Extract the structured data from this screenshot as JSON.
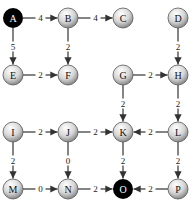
{
  "diagram": {
    "type": "directed-weighted-grid-graph",
    "colors": {
      "edge": "#333333",
      "special_node": "#000000",
      "normal_node_light": "#ffffff",
      "normal_node_dark": "#8a8a8a",
      "label_dark": "#111111",
      "label_light": "#ffffff"
    },
    "nodes": [
      {
        "id": "A",
        "label": "A",
        "x": 13,
        "y": 18,
        "special": true
      },
      {
        "id": "B",
        "label": "B",
        "x": 68,
        "y": 18,
        "special": false
      },
      {
        "id": "C",
        "label": "C",
        "x": 123,
        "y": 18,
        "special": false
      },
      {
        "id": "D",
        "label": "D",
        "x": 178,
        "y": 18,
        "special": false
      },
      {
        "id": "E",
        "label": "E",
        "x": 13,
        "y": 75,
        "special": false
      },
      {
        "id": "F",
        "label": "F",
        "x": 68,
        "y": 75,
        "special": false
      },
      {
        "id": "G",
        "label": "G",
        "x": 123,
        "y": 75,
        "special": false
      },
      {
        "id": "H",
        "label": "H",
        "x": 178,
        "y": 75,
        "special": false
      },
      {
        "id": "I",
        "label": "I",
        "x": 13,
        "y": 132,
        "special": false
      },
      {
        "id": "J",
        "label": "J",
        "x": 68,
        "y": 132,
        "special": false
      },
      {
        "id": "K",
        "label": "K",
        "x": 123,
        "y": 132,
        "special": false
      },
      {
        "id": "L",
        "label": "L",
        "x": 178,
        "y": 132,
        "special": false
      },
      {
        "id": "M",
        "label": "M",
        "x": 13,
        "y": 189,
        "special": false
      },
      {
        "id": "N",
        "label": "N",
        "x": 68,
        "y": 189,
        "special": false
      },
      {
        "id": "O",
        "label": "O",
        "x": 123,
        "y": 189,
        "special": true
      },
      {
        "id": "P",
        "label": "P",
        "x": 178,
        "y": 189,
        "special": false
      }
    ],
    "edges": [
      {
        "from": "A",
        "to": "B",
        "weight": "4"
      },
      {
        "from": "B",
        "to": "C",
        "weight": "4"
      },
      {
        "from": "A",
        "to": "E",
        "weight": "5"
      },
      {
        "from": "B",
        "to": "F",
        "weight": "2"
      },
      {
        "from": "E",
        "to": "F",
        "weight": "2"
      },
      {
        "from": "D",
        "to": "H",
        "weight": "2"
      },
      {
        "from": "G",
        "to": "H",
        "weight": "2"
      },
      {
        "from": "G",
        "to": "K",
        "weight": "2"
      },
      {
        "from": "H",
        "to": "L",
        "weight": "2"
      },
      {
        "from": "I",
        "to": "J",
        "weight": "2"
      },
      {
        "from": "J",
        "to": "K",
        "weight": "2"
      },
      {
        "from": "L",
        "to": "K",
        "weight": "2"
      },
      {
        "from": "I",
        "to": "M",
        "weight": "2"
      },
      {
        "from": "J",
        "to": "N",
        "weight": "0"
      },
      {
        "from": "K",
        "to": "O",
        "weight": "2"
      },
      {
        "from": "L",
        "to": "P",
        "weight": "2"
      },
      {
        "from": "M",
        "to": "N",
        "weight": "0"
      },
      {
        "from": "N",
        "to": "O",
        "weight": "2"
      },
      {
        "from": "P",
        "to": "O",
        "weight": "2"
      }
    ]
  }
}
